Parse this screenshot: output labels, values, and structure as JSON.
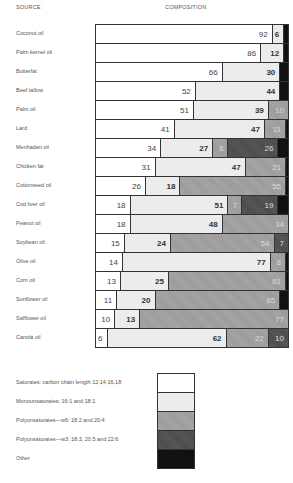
{
  "headers": {
    "source": "SOURCE",
    "composition": "COMPOSITION"
  },
  "colors": {
    "saturates": "#ffffff",
    "monounsaturates": "#ececec",
    "poly_w6": "#9a9a9a",
    "poly_w3": "#4a4a4a",
    "other": "#111111"
  },
  "chart_data": {
    "type": "bar",
    "orientation": "horizontal-stacked-100",
    "title": "",
    "xlabel": "COMPOSITION",
    "ylabel": "SOURCE",
    "categories": [
      "Coconut oil",
      "Palm kernel oil",
      "Butterfat",
      "Beef tallow",
      "Palm oil",
      "Lard",
      "Menhaden oil",
      "Chicken fat",
      "Cottonseed oil",
      "Cod liver oil",
      "Peanut oil",
      "Soybean oil",
      "Olive oil",
      "Corn oil",
      "Sunflower oil",
      "Safflower oil",
      "Canola oil"
    ],
    "series": [
      {
        "name": "Saturates: carbon chain length 12,14,16,18",
        "values": [
          92,
          86,
          66,
          52,
          51,
          41,
          34,
          31,
          26,
          18,
          18,
          15,
          14,
          13,
          11,
          10,
          6
        ]
      },
      {
        "name": "Monounsaturates: 16:1 and 18:1",
        "values": [
          6,
          12,
          30,
          44,
          39,
          47,
          27,
          47,
          18,
          51,
          48,
          24,
          77,
          25,
          20,
          13,
          62
        ]
      },
      {
        "name": "Polyunsaturates—w6: 18:2 and 20:4",
        "values": [
          0,
          0,
          0,
          0,
          10,
          11,
          8,
          21,
          55,
          7,
          34,
          54,
          8,
          61,
          65,
          77,
          22
        ]
      },
      {
        "name": "Polyunsaturates—w3: 18:3, 20:5 and 22:6",
        "values": [
          0,
          0,
          0,
          0,
          0,
          0,
          26,
          0,
          0,
          19,
          0,
          7,
          0,
          0,
          0,
          0,
          10
        ]
      },
      {
        "name": "Other",
        "values": [
          2,
          2,
          4,
          4,
          0,
          1,
          5,
          1,
          1,
          5,
          0,
          0,
          1,
          1,
          4,
          0,
          0
        ]
      }
    ],
    "labels_shown": [
      [
        "92",
        "6",
        "",
        "",
        ""
      ],
      [
        "86",
        "12",
        "",
        "",
        ""
      ],
      [
        "66",
        "30",
        "",
        "",
        ""
      ],
      [
        "52",
        "44",
        "",
        "",
        ""
      ],
      [
        "51",
        "39",
        "10",
        "",
        ""
      ],
      [
        "41",
        "47",
        "11",
        "",
        ""
      ],
      [
        "34",
        "27",
        "8",
        "26",
        ""
      ],
      [
        "31",
        "47",
        "21",
        "",
        ""
      ],
      [
        "26",
        "18",
        "55",
        "",
        ""
      ],
      [
        "18",
        "51",
        "7",
        "19",
        ""
      ],
      [
        "18",
        "48",
        "34",
        "",
        ""
      ],
      [
        "15",
        "24",
        "54",
        "7",
        ""
      ],
      [
        "14",
        "77",
        "8",
        "",
        ""
      ],
      [
        "13",
        "25",
        "61",
        "",
        ""
      ],
      [
        "11",
        "20",
        "65",
        "",
        ""
      ],
      [
        "10",
        "13",
        "77",
        "",
        ""
      ],
      [
        "6",
        "62",
        "22",
        "10",
        ""
      ]
    ],
    "xlim": [
      0,
      100
    ],
    "grid": false,
    "legend_position": "bottom"
  },
  "legend": [
    "Saturates: carbon chain length 12,14,16,18",
    "Monounsaturates: 16:1 and 18:1",
    "Polyunsaturates—w6: 18:2 and 20:4",
    "Polyunsaturates—w3: 18:3, 20:5 and 22:6",
    "Other"
  ]
}
